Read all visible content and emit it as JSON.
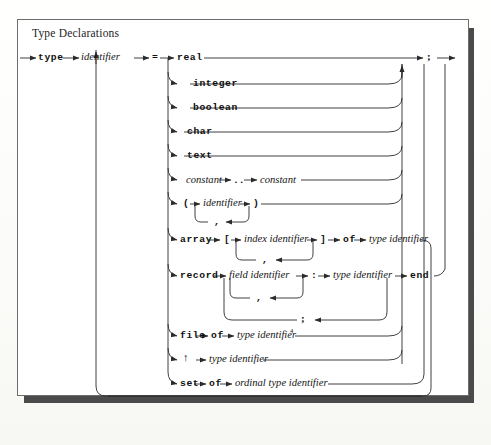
{
  "figure": {
    "title": "Type Declarations",
    "kind": "syntax-railroad-diagram",
    "ink_color": "#2b2b2b",
    "card_color": "#ffffff",
    "shadow_color": "#4a4a4a"
  },
  "head": {
    "kw_type": "type",
    "nt_identifier": "identifier",
    "op_equals": "="
  },
  "tail": {
    "semicolon": ";"
  },
  "alternatives": [
    {
      "id": "real",
      "tokens": [
        "real"
      ]
    },
    {
      "id": "integer",
      "tokens": [
        "integer"
      ]
    },
    {
      "id": "boolean",
      "tokens": [
        "boolean"
      ]
    },
    {
      "id": "char",
      "tokens": [
        "char"
      ]
    },
    {
      "id": "text",
      "tokens": [
        "text"
      ]
    },
    {
      "id": "subrange",
      "tokens": [
        "constant",
        "..",
        "constant"
      ]
    },
    {
      "id": "enumerated",
      "tokens": [
        "(",
        "identifier",
        ")"
      ],
      "loop_separator": ","
    },
    {
      "id": "array",
      "tokens": [
        "array",
        "[",
        "index identifier",
        "]",
        "of",
        "type identifier"
      ],
      "loop_separator": ","
    },
    {
      "id": "record",
      "tokens": [
        "record",
        "field identifier",
        ":",
        "type identifier",
        "end"
      ],
      "loop_separator": ",",
      "outer_loop_separator": ";"
    },
    {
      "id": "file",
      "tokens": [
        "file",
        "of",
        "type identifier"
      ],
      "footnote": "4"
    },
    {
      "id": "pointer",
      "tokens": [
        "↑",
        "type identifier"
      ]
    },
    {
      "id": "set",
      "tokens": [
        "set",
        "of",
        "ordinal type identifier"
      ]
    }
  ],
  "labels": {
    "real": "real",
    "integer": "integer",
    "boolean": "boolean",
    "char": "char",
    "text": "text",
    "constant1": "constant",
    "dotdot": "..",
    "constant2": "constant",
    "paren_open": "(",
    "enum_identifier": "identifier",
    "paren_close": ")",
    "comma_enum": ",",
    "array": "array",
    "bracket_open": "[",
    "index_identifier": "index identifier",
    "bracket_close": "]",
    "of_array": "of",
    "type_identifier_array": "type identifier",
    "comma_array": ",",
    "record": "record",
    "field_identifier": "field identifier",
    "colon": ":",
    "type_identifier_record": "type identifier",
    "end": "end",
    "comma_record": ",",
    "semicolon_record": ";",
    "file": "file",
    "of_file": "of",
    "type_identifier_file": "type identifier",
    "footnote4": "4",
    "uparrow": "↑",
    "type_identifier_pointer": "type identifier",
    "set": "set",
    "of_set": "of",
    "ordinal_type_identifier": "ordinal type identifier"
  }
}
